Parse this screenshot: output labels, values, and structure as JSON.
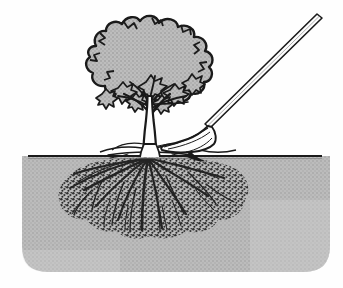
{
  "figure": {
    "title": "Tree with root system being lifted by a spade",
    "caption": "",
    "background_color": "#fefefe",
    "width": 343,
    "height": 288
  },
  "palette": {
    "ink": "#1a1a1a",
    "soil_fill": "#b6b6b6",
    "soil_fill_light": "#c2c2c2",
    "canopy_fill": "#b4b4b4",
    "root_dark": "#2b2b2b",
    "root_mid": "#4a4a4a",
    "paper": "#fefefe",
    "trunk_fill": "#fdfdfd"
  },
  "scene": {
    "ground_line": {
      "label": "soil surface line",
      "y": 156,
      "x_start": 28,
      "x_end": 322,
      "stroke_width": 2
    },
    "soil_block": {
      "label": "soil cross-section",
      "top": 156,
      "bottom": 272,
      "left": 22,
      "right": 330,
      "corner_radius": 26
    },
    "tree": {
      "label": "deciduous tree",
      "canopy": {
        "label": "lobed canopy mass",
        "center_x": 140,
        "center_y": 58,
        "radius_x": 68,
        "radius_y": 46,
        "lobes": 30
      },
      "trunk": {
        "label": "trunk",
        "base_x": 148,
        "base_y": 156,
        "top_y": 98,
        "width_base": 9,
        "width_top": 4
      },
      "branch_count": 9,
      "leaf_cluster_count": 14
    },
    "roots": {
      "label": "fibrous root mass",
      "left": 58,
      "right": 250,
      "top": 158,
      "bottom": 238,
      "crown_x": 148,
      "main_root_count": 14,
      "texture": "dense fibrous stipple"
    },
    "surface_roots": {
      "label": "exposed surface roots",
      "left": 98,
      "right": 236,
      "y": 150
    },
    "spade": {
      "label": "spade tool",
      "handle": {
        "label": "spade handle",
        "top_x": 320,
        "top_y": 20,
        "bottom_x": 208,
        "bottom_y": 130,
        "thickness": 5
      },
      "blade": {
        "label": "spade blade",
        "tip_x": 166,
        "tip_y": 140,
        "heel_x": 212,
        "heel_y": 152
      }
    }
  }
}
